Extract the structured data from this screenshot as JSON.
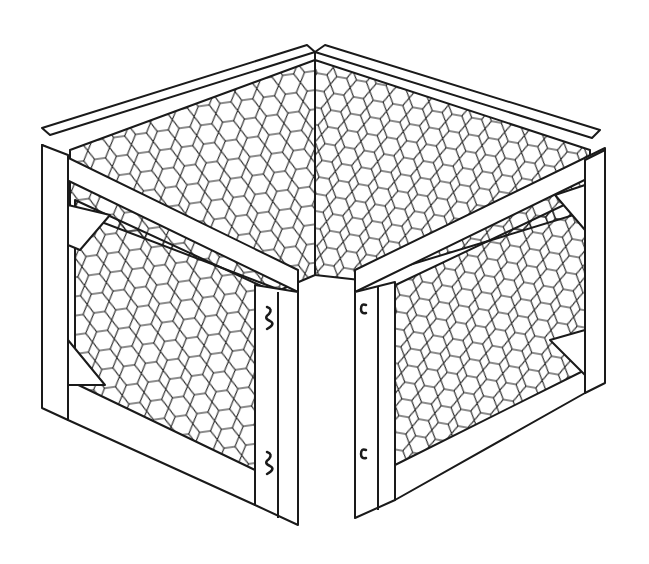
{
  "image": {
    "subject": "Hinged folding wire-mesh enclosure (corner panels) line drawing",
    "style": "black ink line art on white",
    "colors": {
      "ink": "#1a1a1a",
      "background": "#ffffff"
    },
    "elements": {
      "left_panel": {
        "label": ""
      },
      "right_panel": {
        "label": ""
      },
      "hinges_left": 2,
      "hinges_right": 2
    }
  }
}
